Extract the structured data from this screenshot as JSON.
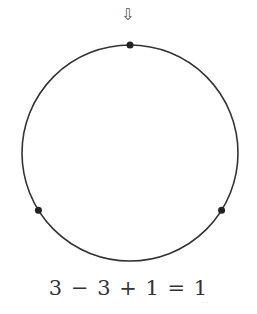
{
  "diagram": {
    "start_arrow": "⇩",
    "points": [
      {
        "name": "top",
        "angle_deg": 90
      },
      {
        "name": "bottom-left",
        "angle_deg": 212
      },
      {
        "name": "bottom-right",
        "angle_deg": 328
      }
    ],
    "equation": "3 − 3 + 1 = 1",
    "faint_mark": "˙˙",
    "colors": {
      "stroke": "#333333",
      "point": "#222222"
    }
  }
}
